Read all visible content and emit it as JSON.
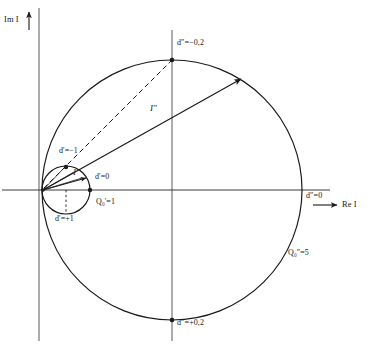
{
  "figure": {
    "background_color": "#ffffff",
    "line_color": "#1a1a1a"
  },
  "axes": {
    "imaginary": {
      "label": "Im I",
      "icon": "up-arrow-icon",
      "direction": "up"
    },
    "real": {
      "label": "Re I",
      "icon": "right-arrow-icon",
      "direction": "right"
    }
  },
  "vectors": [
    {
      "name": "I-single-prime",
      "label": "I'",
      "icon": "arrow-icon",
      "style": "solid",
      "from": "origin",
      "to": "small-circle"
    },
    {
      "name": "I-double-prime",
      "label": "I″",
      "icon": "arrow-icon",
      "style": "solid",
      "from": "origin",
      "to": "large-circle"
    }
  ],
  "circles": [
    {
      "name": "small-circle",
      "quality_label": "Q₀'=1",
      "quality_symbol": "Q",
      "quality_subscript": "0",
      "quality_prime": "'",
      "quality_value": "1"
    },
    {
      "name": "large-circle",
      "quality_label": "Q₀″=5",
      "quality_symbol": "Q",
      "quality_subscript": "0",
      "quality_prime": "″",
      "quality_value": "5"
    }
  ],
  "point_labels": {
    "small_circle": {
      "top_left": "d'=−1",
      "right": "d'=0",
      "bottom": "d'=+1"
    },
    "large_circle": {
      "top": "d″=−0,2",
      "right": "d″=0",
      "bottom": "d″=+0,2"
    }
  },
  "annotations": {
    "dashed_line": "chord from origin to large-circle top point",
    "dotted_line": "vertical drop to small-circle bottom point"
  }
}
